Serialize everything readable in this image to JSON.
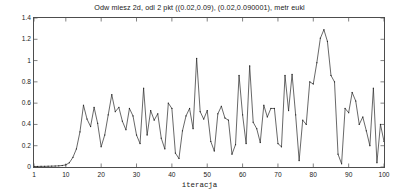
{
  "chart_data": {
    "type": "line",
    "title": "Odw miesz 2d, odl 2 pkt ((0.02,0.09), (0.02,0.090001), metr eukl",
    "xlabel": "iteracja",
    "ylabel": "",
    "xlim": [
      1,
      100
    ],
    "ylim": [
      0,
      1.4
    ],
    "grid": false,
    "legend": null,
    "line_color": "#262626",
    "marker": "point",
    "xticks": [
      1,
      10,
      20,
      30,
      40,
      50,
      60,
      70,
      80,
      90,
      100
    ],
    "xtick_labels": [
      "1",
      "10",
      "20",
      "30",
      "40",
      "50",
      "60",
      "70",
      "80",
      "90",
      "100"
    ],
    "yticks": [
      0,
      0.2,
      0.4,
      0.6,
      0.8,
      1.0,
      1.2,
      1.4
    ],
    "ytick_labels": [
      "0",
      "0.2",
      "0.4",
      "0.6",
      "0.8",
      "1",
      "1.2",
      "1.4"
    ],
    "x": [
      1,
      2,
      3,
      4,
      5,
      6,
      7,
      8,
      9,
      10,
      11,
      12,
      13,
      14,
      15,
      16,
      17,
      18,
      19,
      20,
      21,
      22,
      23,
      24,
      25,
      26,
      27,
      28,
      29,
      30,
      31,
      32,
      33,
      34,
      35,
      36,
      37,
      38,
      39,
      40,
      41,
      42,
      43,
      44,
      45,
      46,
      47,
      48,
      49,
      50,
      51,
      52,
      53,
      54,
      55,
      56,
      57,
      58,
      59,
      60,
      61,
      62,
      63,
      64,
      65,
      66,
      67,
      68,
      69,
      70,
      71,
      72,
      73,
      74,
      75,
      76,
      77,
      78,
      79,
      80,
      81,
      82,
      83,
      84,
      85,
      86,
      87,
      88,
      89,
      90,
      91,
      92,
      93,
      94,
      95,
      96,
      97,
      98,
      99,
      100
    ],
    "values": [
      0.005,
      0.005,
      0.006,
      0.006,
      0.007,
      0.008,
      0.009,
      0.011,
      0.014,
      0.02,
      0.04,
      0.09,
      0.17,
      0.33,
      0.58,
      0.45,
      0.38,
      0.56,
      0.41,
      0.19,
      0.3,
      0.49,
      0.68,
      0.52,
      0.56,
      0.43,
      0.35,
      0.55,
      0.48,
      0.3,
      0.22,
      0.74,
      0.3,
      0.53,
      0.44,
      0.5,
      0.27,
      0.17,
      0.6,
      0.55,
      0.13,
      0.08,
      0.34,
      0.48,
      0.55,
      0.36,
      1.02,
      0.52,
      0.45,
      0.53,
      0.24,
      0.15,
      0.5,
      0.57,
      0.46,
      0.44,
      0.12,
      0.21,
      0.86,
      0.49,
      0.22,
      0.95,
      0.42,
      0.36,
      0.23,
      0.58,
      0.47,
      0.55,
      0.55,
      0.22,
      0.19,
      0.86,
      0.53,
      0.87,
      0.49,
      0.06,
      0.44,
      0.4,
      0.8,
      0.78,
      0.98,
      1.21,
      1.29,
      1.18,
      0.86,
      0.8,
      0.12,
      0.03,
      0.55,
      0.51,
      0.7,
      0.62,
      0.4,
      0.47,
      0.34,
      0.2,
      0.74,
      0.04,
      0.4,
      0.24
    ]
  },
  "axes": {
    "title_name": "chart-title",
    "xaxis_label": "iteracja"
  }
}
